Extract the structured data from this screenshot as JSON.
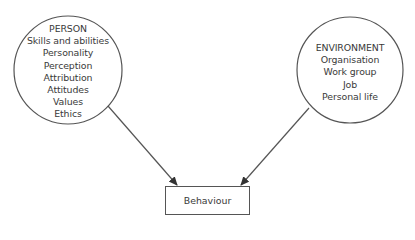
{
  "diagram": {
    "person": {
      "title": "PERSON",
      "items": [
        "Skills and abilities",
        "Personality",
        "Perception",
        "Attribution",
        "Attitudes",
        "Values",
        "Ethics"
      ]
    },
    "environment": {
      "title": "ENVIRONMENT",
      "items": [
        "Organisation",
        "Work group",
        "Job",
        "Personal life"
      ]
    },
    "outcome": {
      "label": "Behaviour"
    },
    "edges": [
      {
        "from": "PERSON",
        "to": "Behaviour"
      },
      {
        "from": "ENVIRONMENT",
        "to": "Behaviour"
      }
    ],
    "colors": {
      "stroke": "#555555",
      "text": "#3a3a3a",
      "background": "#ffffff"
    }
  }
}
